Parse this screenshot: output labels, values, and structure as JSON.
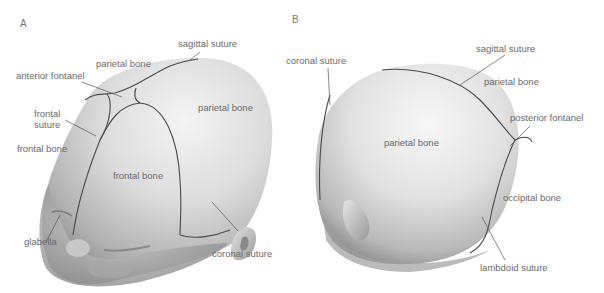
{
  "panels": [
    {
      "id": "A",
      "label": "A",
      "labels": {
        "sagittal_suture": "sagittal suture",
        "parietal_bone_top": "parietal bone",
        "anterior_fontanel": "anterior fontanel",
        "parietal_bone_right": "parietal bone",
        "frontal_suture_line1": "frontal",
        "frontal_suture_line2": "suture",
        "frontal_bone_left": "frontal bone",
        "frontal_bone_center": "frontal bone",
        "glabella": "glabella",
        "coronal_suture": "coronal suture"
      }
    },
    {
      "id": "B",
      "label": "B",
      "labels": {
        "coronal_suture": "coronal suture",
        "sagittal_suture": "sagittal suture",
        "parietal_bone_right": "parietal bone",
        "posterior_fontanel": "posterior fontanel",
        "parietal_bone_center": "parietal bone",
        "occipital_bone": "occipital bone",
        "lambdoid_suture": "lambdoid suture"
      }
    }
  ],
  "colors": {
    "skull_light": "#f2f2f2",
    "skull_mid": "#c8c8c8",
    "skull_dark": "#8e8e8e",
    "suture_line": "#4a4a4a",
    "leader_line": "#555555",
    "label_text": "#6a6a6a"
  }
}
